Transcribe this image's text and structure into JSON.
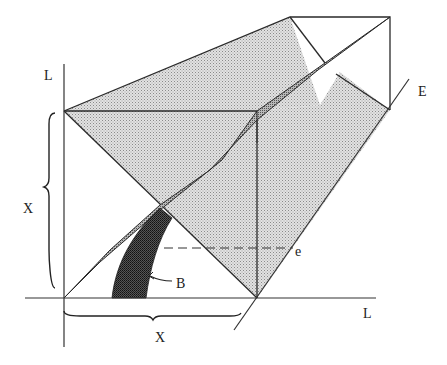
{
  "diagram": {
    "type": "geometric-projection",
    "labels": {
      "vertical_axis": "L",
      "horizontal_axis": "L",
      "diagonal_axis": "E",
      "vertical_extent": "X",
      "horizontal_extent": "X",
      "region": "B",
      "point": "e"
    },
    "colors": {
      "line": "#2a2a2a",
      "light_fill": "#d4d4d4",
      "medium_fill": "#9a9a9a",
      "dark_fill": "#3a3a3a",
      "background": "#ffffff"
    }
  }
}
